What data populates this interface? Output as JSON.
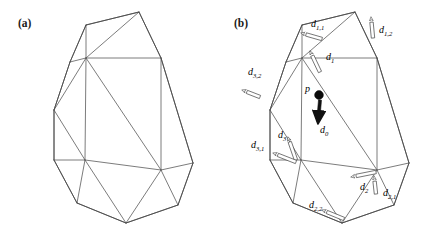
{
  "figure": {
    "width": 432,
    "height": 230,
    "background": "#ffffff",
    "line_color": "#5a5a5a",
    "label_color": "#000000"
  },
  "panels": [
    {
      "id": "a",
      "label": "(a)",
      "caption_position": "top-left",
      "has_annotations": false
    },
    {
      "id": "b",
      "label": "(b)",
      "caption_position": "top-left",
      "has_annotations": true
    }
  ],
  "panel_a": {
    "label": "(a)",
    "outline": "70,62 86,25 139,12 161,58 193,163 178,205 126,223 77,203 54,160 54,110",
    "edges": [
      "70,62 86,25",
      "86,25 139,12",
      "139,12 161,58",
      "161,58 193,163",
      "193,163 178,205",
      "178,205 126,223",
      "126,223 77,203",
      "77,203 54,160",
      "54,160 54,110",
      "54,110 70,62",
      "70,62 86,58",
      "86,58 86,25",
      "86,58 139,12",
      "86,58 161,58",
      "86,58 54,110",
      "86,58 85,160",
      "86,58 161,170",
      "85,160 54,160",
      "85,160 54,110",
      "85,160 161,170",
      "85,160 77,203",
      "85,160 126,223",
      "161,170 161,58",
      "161,170 193,163",
      "161,170 126,223",
      "161,170 178,205"
    ]
  },
  "panel_b": {
    "label": "(b)",
    "outline": "70,62 86,25 139,12 161,58 193,163 178,205 126,223 77,203 54,160 54,110",
    "edges": [
      "70,62 86,25",
      "86,25 139,12",
      "139,12 161,58",
      "161,58 193,163",
      "193,163 178,205",
      "178,205 126,223",
      "126,223 77,203",
      "77,203 54,160",
      "54,160 54,110",
      "54,110 70,62",
      "70,62 86,58",
      "86,58 86,25",
      "86,58 139,12",
      "86,58 161,58",
      "86,58 54,110",
      "86,58 85,160",
      "86,58 161,170",
      "85,160 54,160",
      "85,160 54,110",
      "85,160 161,170",
      "85,160 77,203",
      "85,160 126,223",
      "161,170 161,58",
      "161,170 193,163",
      "161,170 126,223",
      "161,170 178,205"
    ],
    "point": {
      "name": "p",
      "label": "p",
      "x": 103,
      "y": 95,
      "radius": 4.4
    },
    "vectors": [
      {
        "id": "d0",
        "base": "d",
        "subscript": "0",
        "label_x": 104,
        "label_y": 133,
        "arrow_style": "solid",
        "arrow_from": "104,100",
        "arrow_to": "102,123"
      },
      {
        "id": "d1",
        "base": "d",
        "subscript": "1",
        "label_x": 110,
        "label_y": 60,
        "arrow_style": "hollow",
        "arrow_from": "104,72",
        "arrow_to": "94,51"
      },
      {
        "id": "d1_1",
        "base": "d",
        "subscript": "1,1",
        "label_x": 95,
        "label_y": 27,
        "arrow_style": "hollow",
        "arrow_from": "106,39",
        "arrow_to": "85,33"
      },
      {
        "id": "d1_2",
        "base": "d",
        "subscript": "1,2",
        "label_x": 163,
        "label_y": 33,
        "arrow_style": "hollow",
        "arrow_from": "157,38",
        "arrow_to": "155,17"
      },
      {
        "id": "d2",
        "base": "d",
        "subscript": "2",
        "label_x": 144,
        "label_y": 190,
        "arrow_style": "hollow",
        "arrow_from": "160,172",
        "arrow_to": "135,177"
      },
      {
        "id": "d2_1",
        "base": "d",
        "subscript": "2,1",
        "label_x": 167,
        "label_y": 196,
        "arrow_style": "hollow",
        "arrow_from": "160,194",
        "arrow_to": "158,176"
      },
      {
        "id": "d2_2",
        "base": "d",
        "subscript": "2,2",
        "label_x": 93,
        "label_y": 208,
        "arrow_style": "hollow",
        "arrow_from": "128,219",
        "arrow_to": "106,210"
      },
      {
        "id": "d3",
        "base": "d",
        "subscript": "3",
        "label_x": 62,
        "label_y": 138,
        "arrow_style": "hollow",
        "arrow_from": "80,160",
        "arrow_to": "72,137"
      },
      {
        "id": "d3_1",
        "base": "d",
        "subscript": "3,1",
        "label_x": 35,
        "label_y": 148,
        "arrow_style": "hollow",
        "arrow_from": "80,162",
        "arrow_to": "57,153"
      },
      {
        "id": "d3_2",
        "base": "d",
        "subscript": "3,2",
        "label_x": 32,
        "label_y": 75,
        "arrow_style": "hollow",
        "arrow_from": "44,97",
        "arrow_to": "26,90"
      }
    ]
  }
}
